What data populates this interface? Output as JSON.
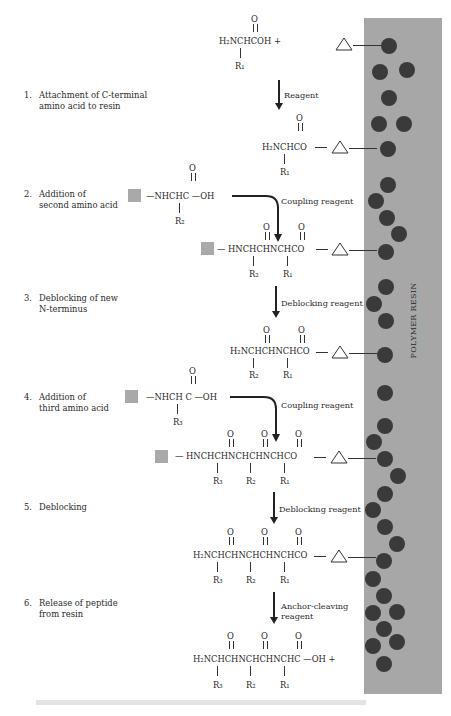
{
  "resin": {
    "label": "POLYMER RESIN",
    "color": "#a7a7a7",
    "bead_color": "#3a3a3a"
  },
  "steps": [
    {
      "num": "1.",
      "line1": "Attachment of C-terminal",
      "line2": "amino acid to resin"
    },
    {
      "num": "2.",
      "line1": "Addition of",
      "line2": "second amino acid"
    },
    {
      "num": "3.",
      "line1": "Deblocking of new",
      "line2": "N-terminus"
    },
    {
      "num": "4.",
      "line1": "Addition of",
      "line2": "third amino acid"
    },
    {
      "num": "5.",
      "line1": "Deblocking",
      "line2": ""
    },
    {
      "num": "6.",
      "line1": "Release of peptide",
      "line2": "from resin"
    }
  ],
  "reagents": {
    "r1": "Reagent",
    "r2": "Coupling reagent",
    "r3": "Deblocking reagent",
    "r4": "Coupling reagent",
    "r5": "Deblocking reagent",
    "r6a": "Anchor-cleaving",
    "r6b": "reagent"
  },
  "structures": {
    "aa1": {
      "o": "O",
      "main": "H₂NCHCOH +",
      "r": "R₁"
    },
    "anchored1": {
      "o": "O",
      "main": "H₂NCHCO",
      "r": "R₁"
    },
    "aa2": {
      "o": "O",
      "main": "—NHCHC —OH",
      "r": "R₂"
    },
    "dipep_blocked": {
      "os": [
        "O",
        "O"
      ],
      "main": "— HNCHCHNCHCO",
      "rs": [
        "R₂",
        "R₁"
      ]
    },
    "dipep_free": {
      "os": [
        "O",
        "O"
      ],
      "main": "H₂NCHCHNCHCO",
      "rs": [
        "R₂",
        "R₁"
      ]
    },
    "aa3": {
      "o": "O",
      "main": "—NHCH C —OH",
      "r": "R₃"
    },
    "tripep_blocked": {
      "os": [
        "O",
        "O",
        "O"
      ],
      "main": "—  HNCHCHNCHCHNCHCO",
      "rs": [
        "R₃",
        "R₂",
        "R₁"
      ]
    },
    "tripep_free": {
      "os": [
        "O",
        "O",
        "O"
      ],
      "main": "H₂NCHCHNCHCHNCHCO",
      "rs": [
        "R₃",
        "R₂",
        "R₁"
      ]
    },
    "product": {
      "os": [
        "O",
        "O",
        "O"
      ],
      "main": "H₂NCHCHNCHCHNCHC —OH +",
      "rs": [
        "R₃",
        "R₂",
        "R₁"
      ]
    }
  },
  "symbols": {
    "anchor": "triangle-anchor",
    "protecting_group": "gray-square",
    "resin_bead": "dark-circle"
  }
}
